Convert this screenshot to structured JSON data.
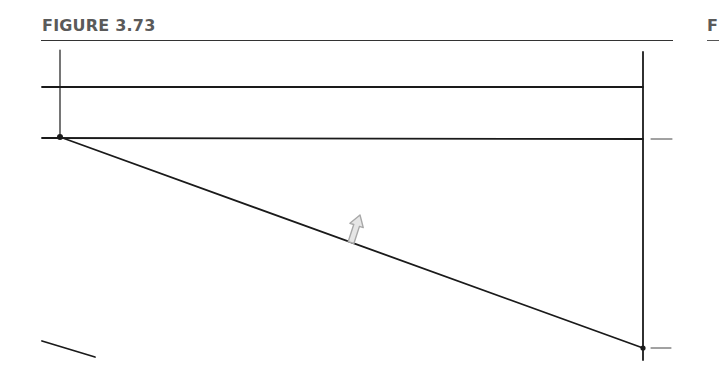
{
  "figure": {
    "title": "FIGURE 3.73",
    "next_figure_label_fragment": "F"
  },
  "drawing": {
    "stroke_color": "#1a1a1a",
    "cursor_color": "#b0b0b0",
    "elements": [
      {
        "name": "left-vertical-line",
        "x1": 60,
        "y1": 50,
        "x2": 60,
        "y2": 137
      },
      {
        "name": "top-horizontal-line",
        "x1": 42,
        "y1": 87,
        "x2": 643,
        "y2": 87
      },
      {
        "name": "middle-horizontal-line",
        "x1": 42,
        "y1": 138,
        "x2": 643,
        "y2": 139
      },
      {
        "name": "right-vertical-line",
        "x1": 643,
        "y1": 52,
        "x2": 643,
        "y2": 360
      },
      {
        "name": "diagonal-line",
        "x1": 60,
        "y1": 137,
        "x2": 643,
        "y2": 348
      },
      {
        "name": "bottom-left-partial-line",
        "x1": 42,
        "y1": 341,
        "x2": 95,
        "y2": 357
      },
      {
        "name": "right-tick-upper",
        "x1": 651,
        "y1": 139,
        "x2": 672,
        "y2": 139
      },
      {
        "name": "right-tick-lower",
        "x1": 651,
        "y1": 348,
        "x2": 671,
        "y2": 348
      }
    ],
    "points": [
      {
        "name": "upper-left-endpoint",
        "x": 60,
        "y": 137
      },
      {
        "name": "lower-right-endpoint",
        "x": 643,
        "y": 348
      }
    ],
    "cursor": {
      "name": "mouse-cursor",
      "tip_x": 360,
      "tip_y": 215
    }
  }
}
